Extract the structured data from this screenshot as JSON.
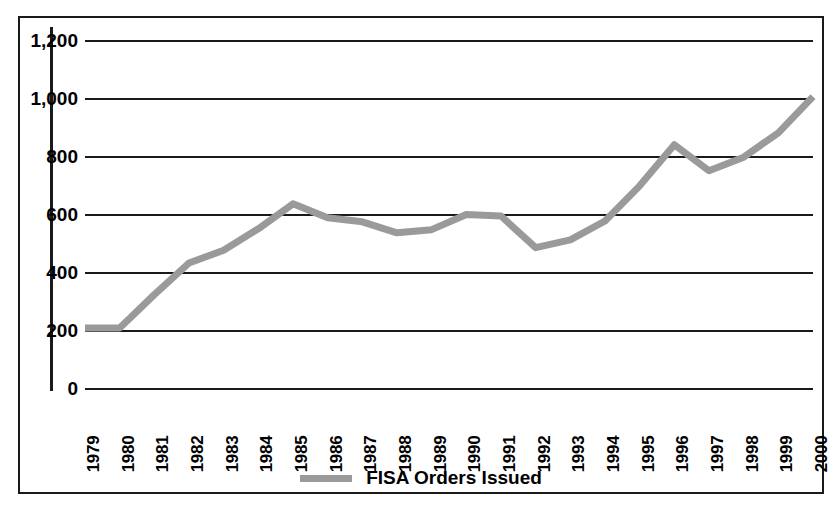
{
  "chart_data": {
    "type": "line",
    "title": "",
    "xlabel": "",
    "ylabel": "",
    "grid": true,
    "legend_position": "bottom-center",
    "ylim": [
      0,
      1200
    ],
    "ytick_labels": [
      "1,200",
      "1,000",
      "800",
      "600",
      "400",
      "200",
      "0"
    ],
    "ytick_values": [
      1200,
      1000,
      800,
      600,
      400,
      200,
      0
    ],
    "categories": [
      "1979",
      "1980",
      "1981",
      "1982",
      "1983",
      "1984",
      "1985",
      "1986",
      "1987",
      "1988",
      "1989",
      "1990",
      "1991",
      "1992",
      "1993",
      "1994",
      "1995",
      "1996",
      "1997",
      "1998",
      "1999",
      "2000"
    ],
    "series": [
      {
        "name": "FISA Orders Issued",
        "color": "#9a9a9a",
        "values": [
          207,
          207,
          322,
          431,
          475,
          549,
          635,
          587,
          573,
          535,
          546,
          598,
          593,
          484,
          511,
          576,
          697,
          839,
          749,
          796,
          880,
          1005
        ]
      }
    ]
  },
  "legend": {
    "entries": [
      {
        "label": "FISA Orders Issued",
        "swatch": "line-swatch"
      }
    ]
  }
}
